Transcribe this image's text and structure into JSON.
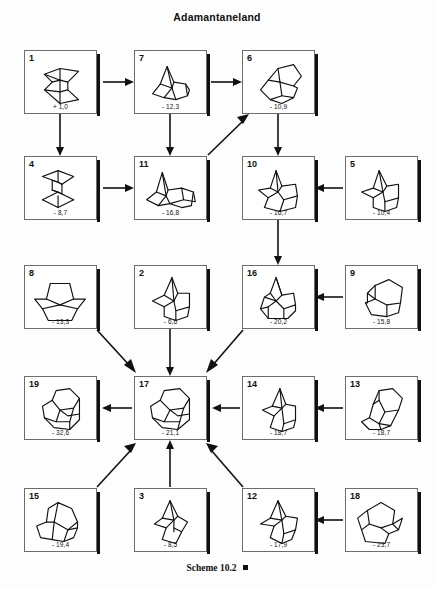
{
  "header": {
    "title": "Adamantaneland"
  },
  "footer": {
    "caption": "Scheme 10.2",
    "marker": "filled-square"
  },
  "diagram": {
    "type": "reaction-network",
    "value_unit": "kcal/mol",
    "nodes": [
      {
        "id": "1",
        "label": "1",
        "value": "+ 1,0",
        "x": 24,
        "y": 50,
        "w": 73,
        "h": 64
      },
      {
        "id": "7",
        "label": "7",
        "value": "- 12,3",
        "x": 134,
        "y": 50,
        "w": 73,
        "h": 64
      },
      {
        "id": "6",
        "label": "6",
        "value": "- 10,9",
        "x": 242,
        "y": 50,
        "w": 73,
        "h": 64
      },
      {
        "id": "4",
        "label": "4",
        "value": "- 8,7",
        "x": 24,
        "y": 156,
        "w": 73,
        "h": 64
      },
      {
        "id": "11",
        "label": "11",
        "value": "- 16,8",
        "x": 134,
        "y": 156,
        "w": 73,
        "h": 64
      },
      {
        "id": "10",
        "label": "10",
        "value": "- 16,7",
        "x": 242,
        "y": 156,
        "w": 73,
        "h": 64
      },
      {
        "id": "5",
        "label": "5",
        "value": "- 10,4",
        "x": 345,
        "y": 156,
        "w": 73,
        "h": 64
      },
      {
        "id": "8",
        "label": "8",
        "value": "- 13,3",
        "x": 24,
        "y": 265,
        "w": 73,
        "h": 64
      },
      {
        "id": "2",
        "label": "2",
        "value": "- 6,6",
        "x": 134,
        "y": 265,
        "w": 73,
        "h": 64
      },
      {
        "id": "16",
        "label": "16",
        "value": "- 20,2",
        "x": 242,
        "y": 265,
        "w": 73,
        "h": 64
      },
      {
        "id": "9",
        "label": "9",
        "value": "- 15,8",
        "x": 345,
        "y": 265,
        "w": 73,
        "h": 64
      },
      {
        "id": "19",
        "label": "19",
        "value": "- 32,6",
        "x": 24,
        "y": 376,
        "w": 73,
        "h": 64
      },
      {
        "id": "17",
        "label": "17",
        "value": "- 21,1",
        "x": 134,
        "y": 376,
        "w": 73,
        "h": 64
      },
      {
        "id": "14",
        "label": "14",
        "value": "- 18,7",
        "x": 242,
        "y": 376,
        "w": 73,
        "h": 64
      },
      {
        "id": "13",
        "label": "13",
        "value": "- 18,7",
        "x": 345,
        "y": 376,
        "w": 73,
        "h": 64
      },
      {
        "id": "15",
        "label": "15",
        "value": "- 19,4",
        "x": 24,
        "y": 488,
        "w": 73,
        "h": 64
      },
      {
        "id": "3",
        "label": "3",
        "value": "- 8,5",
        "x": 134,
        "y": 488,
        "w": 73,
        "h": 64
      },
      {
        "id": "12",
        "label": "12",
        "value": "- 17,9",
        "x": 242,
        "y": 488,
        "w": 73,
        "h": 64
      },
      {
        "id": "18",
        "label": "18",
        "value": "- 23,7",
        "x": 345,
        "y": 488,
        "w": 73,
        "h": 64
      }
    ],
    "arrows": [
      {
        "from": "1",
        "to": "7"
      },
      {
        "from": "7",
        "to": "6"
      },
      {
        "from": "1",
        "to": "4"
      },
      {
        "from": "7",
        "to": "11"
      },
      {
        "from": "6",
        "to": "10"
      },
      {
        "from": "4",
        "to": "11"
      },
      {
        "from": "11",
        "to": "6"
      },
      {
        "from": "5",
        "to": "10"
      },
      {
        "from": "10",
        "to": "16"
      },
      {
        "from": "9",
        "to": "16"
      },
      {
        "from": "8",
        "to": "17"
      },
      {
        "from": "2",
        "to": "17"
      },
      {
        "from": "16",
        "to": "17"
      },
      {
        "from": "17",
        "to": "19"
      },
      {
        "from": "14",
        "to": "17"
      },
      {
        "from": "13",
        "to": "14"
      },
      {
        "from": "15",
        "to": "17"
      },
      {
        "from": "3",
        "to": "17"
      },
      {
        "from": "12",
        "to": "17"
      },
      {
        "from": "18",
        "to": "12"
      }
    ]
  }
}
